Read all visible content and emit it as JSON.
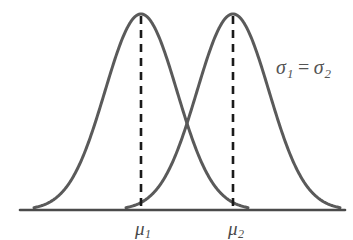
{
  "figure": {
    "background_color": "#ffffff",
    "curve_color": "#5a5a5a",
    "axis_color": "#4a4a4a",
    "dash_color": "#1a1a1a"
  },
  "annotation": {
    "sigma_symbol_1": "σ",
    "sigma_sub_1": "1",
    "equals": "=",
    "sigma_symbol_2": "σ",
    "sigma_sub_2": "2",
    "full_text": "σ₁ = σ₂"
  },
  "x_labels": [
    {
      "symbol": "μ",
      "subscript": "1",
      "full_text": "μ₁"
    },
    {
      "symbol": "μ",
      "subscript": "2",
      "full_text": "μ₂"
    }
  ],
  "chart_data": {
    "type": "line",
    "title": "",
    "xlabel": "",
    "ylabel": "",
    "grid": false,
    "legend": "none",
    "axis": {
      "baseline_only": true,
      "x_tick_labels": [
        "μ₁",
        "μ₂"
      ],
      "x_tick_positions": [
        141,
        233
      ],
      "y_axis_shown": false
    },
    "annotations": [
      {
        "text": "σ₁ = σ₂",
        "x": 276,
        "y": 68,
        "meaning": "equal standard deviations"
      }
    ],
    "series": [
      {
        "name": "Normal distribution 1",
        "distribution": "normal",
        "mean_label": "μ₁",
        "mean_x": 141,
        "sigma_label": "σ₁",
        "peak_y": 14,
        "baseline_y": 210,
        "left_tail_x": 34,
        "right_tail_x": 248,
        "sigma_px": 36
      },
      {
        "name": "Normal distribution 2",
        "distribution": "normal",
        "mean_label": "μ₂",
        "mean_x": 233,
        "sigma_label": "σ₂",
        "peak_y": 14,
        "baseline_y": 210,
        "left_tail_x": 126,
        "right_tail_x": 340,
        "sigma_px": 36
      }
    ],
    "intersection": {
      "x": 187,
      "y": 130
    },
    "note": "Two overlapping normal curves with equal spread and different means"
  }
}
